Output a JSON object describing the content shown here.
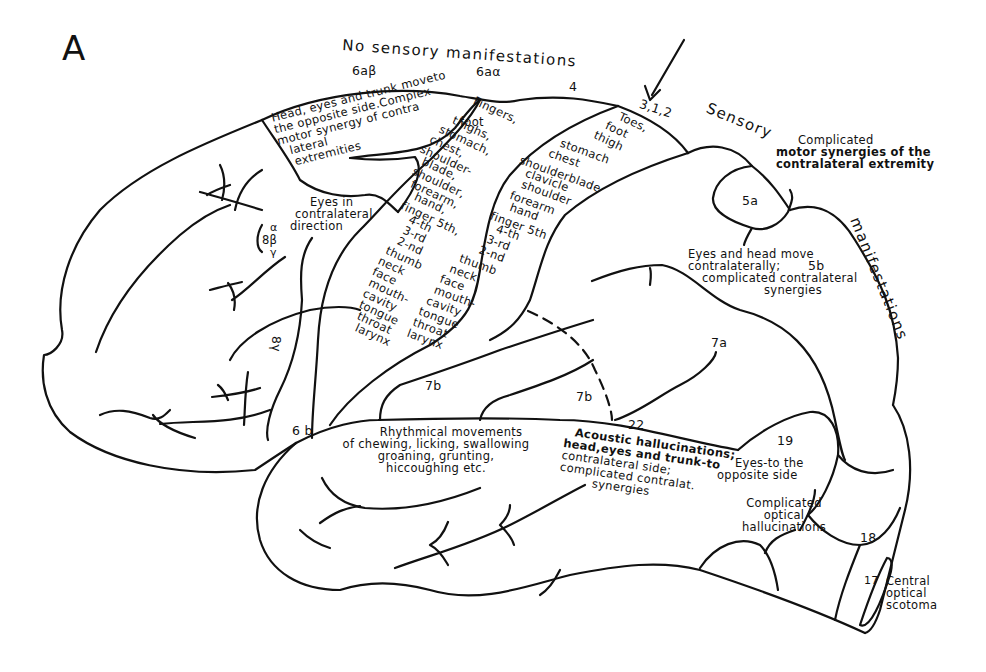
{
  "figure": {
    "panel_letter": "A",
    "headings": {
      "no_sensory": "No sensory manifestations",
      "sensory": "Sensory",
      "manifestations": "manifestations"
    },
    "area_labels": {
      "a6ab": "6aβ",
      "a6aa": "6aα",
      "a4": "4",
      "a312": "3,1,2",
      "a5a": "5a",
      "a5b": "5b",
      "a7a": "7a",
      "a7b_upper": "7b",
      "a7b_lower": "7b",
      "a22": "22",
      "a19": "19",
      "a18": "18",
      "a17": "17",
      "a6b": "6 b",
      "a8_alpha": "α",
      "a8_beta": "8β",
      "a8_gamma": "γ",
      "a8_gamma_vertical": "8γ"
    },
    "annotations": {
      "area_6ab": [
        "Head, eyes and trunk moveto",
        "the opposite side.Complex",
        "motor synergy of contra",
        "lateral",
        "extremities"
      ],
      "eyes_contralateral": [
        "Eyes in",
        "contralateral",
        "direction"
      ],
      "area_4_somatotopy": [
        "Fingers,",
        "foot",
        "thighs,",
        "stomach,",
        "chest,",
        "shoulder-",
        "blade,",
        "shoulder,",
        "forearm,",
        "hand,",
        "finger 5th,",
        "4-th",
        "3-rd",
        "2-nd",
        "thumb",
        "neck",
        "face",
        "mouth-",
        "cavity",
        "tongue",
        "throat",
        "larynx"
      ],
      "area_312_somatotopy": [
        "Toes,",
        "foot",
        "thigh",
        "stomach",
        "chest",
        "shoulderblade",
        "clavicle",
        "shoulder",
        "forearm",
        "hand",
        "finger 5th",
        "4-th",
        "3-rd",
        "2-nd",
        "thumb",
        "neck",
        "face",
        "mouth-",
        "cavity",
        "tongue",
        "throat",
        "larynx"
      ],
      "complicated_motor": [
        "Complicated",
        "motor synergies of the",
        "contralateral extremity"
      ],
      "area_5b": [
        "Eyes and head move",
        "contralaterally;",
        "complicated contralateral",
        "synergies"
      ],
      "rhythmical": [
        "Rhythmical movements",
        "of chewing, licking, swallowing",
        "groaning, grunting,",
        "hiccoughing etc."
      ],
      "acoustic": [
        "Acoustic hallucinations;",
        "head,eyes and trunk-to",
        "contralateral side;",
        "complicated contralat.",
        "synergies"
      ],
      "area_19": [
        "Eyes-to the",
        "opposite side"
      ],
      "optical_hallucinations": [
        "Complicated",
        "optical",
        "hallucinations"
      ],
      "scotoma": [
        "Central",
        "optical",
        "scotoma"
      ]
    },
    "colors": {
      "ink": "#111111",
      "paper": "#ffffff"
    }
  }
}
